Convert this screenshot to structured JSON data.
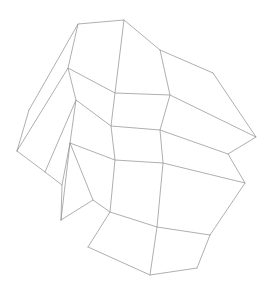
{
  "figure": {
    "type": "wireframe-mesh",
    "background_color": "#ffffff",
    "line_color": "#8c8c8c",
    "line_width": 0.7,
    "width": 269,
    "height": 293,
    "rows": 4,
    "cols": 4,
    "vertex_rows": 5,
    "vertex_cols": 5
  },
  "chart_data": {
    "type": "line",
    "subtitle": "",
    "xlabel": "",
    "ylabel": "",
    "xlim": [
      0,
      269
    ],
    "ylim": [
      0,
      293
    ],
    "grid": false,
    "legend": "none",
    "annotations": [],
    "grid_vertices": [
      [
        {
          "x": 29,
          "y": 110
        },
        {
          "x": 78,
          "y": 24
        },
        {
          "x": 124,
          "y": 20
        },
        {
          "x": 160,
          "y": 50
        },
        {
          "x": 213,
          "y": 73
        }
      ],
      [
        {
          "x": 17,
          "y": 151
        },
        {
          "x": 68,
          "y": 68
        },
        {
          "x": 115,
          "y": 93
        },
        {
          "x": 170,
          "y": 95
        },
        {
          "x": 256,
          "y": 137
        }
      ],
      [
        {
          "x": 45,
          "y": 172
        },
        {
          "x": 76,
          "y": 100
        },
        {
          "x": 111,
          "y": 126
        },
        {
          "x": 160,
          "y": 130
        },
        {
          "x": 228,
          "y": 154
        }
      ],
      [
        {
          "x": 62,
          "y": 185
        },
        {
          "x": 70,
          "y": 143
        },
        {
          "x": 115,
          "y": 160
        },
        {
          "x": 163,
          "y": 163
        },
        {
          "x": 245,
          "y": 183
        }
      ],
      [
        {
          "x": 61,
          "y": 220
        },
        {
          "x": 93,
          "y": 200
        },
        {
          "x": 110,
          "y": 212
        },
        {
          "x": 157,
          "y": 227
        },
        {
          "x": 210,
          "y": 235
        }
      ]
    ],
    "extra_rows": [
      [
        {
          "x": 88,
          "y": 247
        },
        {
          "x": 150,
          "y": 275
        },
        {
          "x": 197,
          "y": 268
        }
      ]
    ],
    "outline_extremes": {
      "leftmost": {
        "x": 17,
        "y": 151
      },
      "rightmost": {
        "x": 256,
        "y": 137
      },
      "topmost": {
        "x": 124,
        "y": 20
      },
      "bottommost": {
        "x": 150,
        "y": 275
      }
    },
    "polylines": [
      {
        "name": "row-0",
        "points": [
          [
            29,
            110
          ],
          [
            78,
            24
          ],
          [
            124,
            20
          ],
          [
            160,
            50
          ],
          [
            213,
            73
          ]
        ]
      },
      {
        "name": "row-1",
        "points": [
          [
            17,
            151
          ],
          [
            68,
            68
          ],
          [
            115,
            93
          ],
          [
            170,
            95
          ],
          [
            256,
            137
          ]
        ]
      },
      {
        "name": "row-2",
        "points": [
          [
            45,
            172
          ],
          [
            76,
            100
          ],
          [
            111,
            126
          ],
          [
            160,
            130
          ],
          [
            228,
            154
          ]
        ]
      },
      {
        "name": "row-3",
        "points": [
          [
            62,
            185
          ],
          [
            70,
            143
          ],
          [
            115,
            160
          ],
          [
            163,
            163
          ],
          [
            245,
            183
          ]
        ]
      },
      {
        "name": "row-4",
        "points": [
          [
            61,
            220
          ],
          [
            93,
            200
          ],
          [
            110,
            212
          ],
          [
            157,
            227
          ],
          [
            210,
            235
          ]
        ]
      },
      {
        "name": "row-5",
        "points": [
          [
            88,
            247
          ],
          [
            150,
            275
          ],
          [
            197,
            268
          ]
        ]
      },
      {
        "name": "col-0",
        "points": [
          [
            29,
            110
          ],
          [
            17,
            151
          ]
        ]
      },
      {
        "name": "col-1",
        "points": [
          [
            78,
            24
          ],
          [
            68,
            68
          ],
          [
            76,
            100
          ],
          [
            70,
            143
          ],
          [
            61,
            220
          ]
        ]
      },
      {
        "name": "col-2",
        "points": [
          [
            124,
            20
          ],
          [
            115,
            93
          ],
          [
            111,
            126
          ],
          [
            115,
            160
          ],
          [
            110,
            212
          ],
          [
            88,
            247
          ]
        ]
      },
      {
        "name": "col-3",
        "points": [
          [
            160,
            50
          ],
          [
            170,
            95
          ],
          [
            160,
            130
          ],
          [
            163,
            163
          ],
          [
            157,
            227
          ],
          [
            150,
            275
          ]
        ]
      },
      {
        "name": "col-4",
        "points": [
          [
            213,
            73
          ],
          [
            256,
            137
          ],
          [
            228,
            154
          ],
          [
            245,
            183
          ],
          [
            210,
            235
          ],
          [
            197,
            268
          ]
        ]
      },
      {
        "name": "col-left-lower",
        "points": [
          [
            17,
            151
          ],
          [
            45,
            172
          ],
          [
            62,
            185
          ],
          [
            61,
            220
          ]
        ]
      },
      {
        "name": "col-1-lower-link",
        "points": [
          [
            70,
            143
          ],
          [
            93,
            200
          ]
        ]
      }
    ]
  }
}
